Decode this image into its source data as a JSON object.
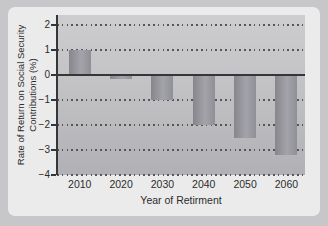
{
  "chart_data": {
    "type": "bar",
    "categories": [
      "2010",
      "2020",
      "2030",
      "2040",
      "2050",
      "2060"
    ],
    "values": [
      1.0,
      -0.15,
      -1.0,
      -2.0,
      -2.5,
      -3.2
    ],
    "title": "",
    "xlabel": "Year of Retirment",
    "ylabel_line1": "Rate of Return on Social Security",
    "ylabel_line2": "Contributions (%)",
    "yticks": [
      2,
      1,
      0,
      -1,
      -2,
      -3,
      -4
    ],
    "ylim": [
      -4,
      2.4
    ],
    "grid": "dotted horizontal lines at integer values, solid line at zero",
    "legend": "none",
    "colors": {
      "frame": "#c7c7c9",
      "panel": "#ebebeb",
      "plot_top": "#cdcdcf",
      "plot_bottom": "#b1b1b5",
      "grid": "#55555a",
      "axis": "#35353a",
      "bar_dark": "#86868d",
      "bar_light": "#a3a3a9",
      "text": "#2b2b2b"
    }
  }
}
